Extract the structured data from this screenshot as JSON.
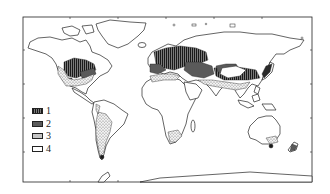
{
  "map": {
    "type": "world-map",
    "projection": "equirectangular",
    "frame": {
      "x": 23,
      "y": 17,
      "width": 289,
      "height": 165
    },
    "colors": {
      "background": "#ffffff",
      "outline": "#222222",
      "category_1": "#3a3a3a",
      "category_2": "#6a6a6a",
      "category_3": "#d8d8d8",
      "category_4": "#ffffff"
    },
    "regions": [
      {
        "name": "north-america-central",
        "category": 1
      },
      {
        "name": "north-america-east",
        "category": 2
      },
      {
        "name": "north-america-west-south",
        "category": 3
      },
      {
        "name": "europe",
        "category": 1
      },
      {
        "name": "europe-southwest",
        "category": 2
      },
      {
        "name": "central-asia",
        "category": 2
      },
      {
        "name": "east-asia",
        "category": 1
      },
      {
        "name": "japan",
        "category": 1
      },
      {
        "name": "north-africa-coast",
        "category": 3
      },
      {
        "name": "south-asia",
        "category": 3
      },
      {
        "name": "south-america-south",
        "category": 3
      },
      {
        "name": "south-africa",
        "category": 3
      },
      {
        "name": "australia-southeast",
        "category": 3
      },
      {
        "name": "tasmania",
        "category": 1
      },
      {
        "name": "new-zealand",
        "category": 2
      },
      {
        "name": "tierra-del-fuego",
        "category": 1
      }
    ]
  },
  "legend": {
    "items": [
      {
        "label": "1",
        "pattern": "vertical-hatch-dark"
      },
      {
        "label": "2",
        "pattern": "solid-dark-gray"
      },
      {
        "label": "3",
        "pattern": "stipple-dots"
      },
      {
        "label": "4",
        "pattern": "blank-white"
      }
    ]
  }
}
